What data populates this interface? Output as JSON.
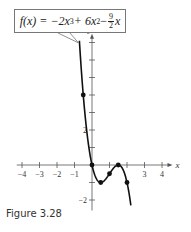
{
  "figure": {
    "caption": "Figure 3.28",
    "formula_label": {
      "lhs": "f(x) = −2x",
      "exp1": "3",
      "mid": " + 6x",
      "exp2": "2",
      "minus": " − ",
      "frac_num": "9",
      "frac_den": "2",
      "tail": "x"
    }
  },
  "chart_data": {
    "type": "line",
    "xlabel": "x",
    "ylabel": "y",
    "xlim": [
      -4.3,
      4.6
    ],
    "ylim": [
      -2.6,
      7.5
    ],
    "x_ticks": [
      -4,
      -3,
      -2,
      -1,
      1,
      2,
      3,
      4
    ],
    "x_tick_labels": [
      "-4",
      "-3",
      "-2",
      "-1",
      "3",
      "4"
    ],
    "x_tick_label_values": [
      -4,
      -3,
      -2,
      -1,
      3,
      4
    ],
    "y_ticks": [
      -2,
      -1,
      1,
      2,
      3,
      4,
      5,
      6,
      7
    ],
    "y_tick_labels": [
      "2",
      "-2"
    ],
    "y_tick_label_values": [
      2,
      -2
    ],
    "grid": false,
    "legend": "none",
    "curve": {
      "function": "-2x^3 + 6x^2 - 4.5x",
      "x_range": [
        -0.72,
        2.22
      ]
    },
    "points": [
      {
        "x": -0.5,
        "y": 4
      },
      {
        "x": 0,
        "y": 0
      },
      {
        "x": 0.5,
        "y": -1
      },
      {
        "x": 1,
        "y": -0.5
      },
      {
        "x": 1.5,
        "y": 0
      },
      {
        "x": 2,
        "y": -1
      }
    ],
    "colors": {
      "curve": "#111111",
      "axes": "#555555",
      "text": "#333333"
    }
  }
}
